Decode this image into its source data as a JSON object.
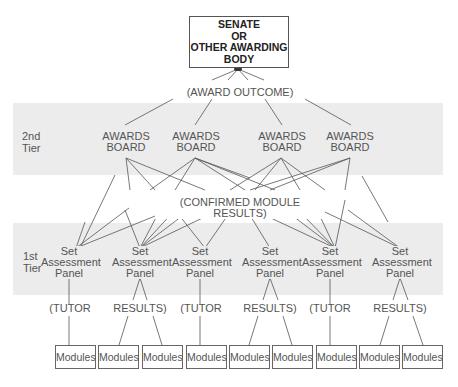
{
  "diagram": {
    "top_body": {
      "lines": [
        "SENATE",
        "OR",
        "OTHER AWARDING",
        "BODY"
      ]
    },
    "award_outcome_label": "(AWARD OUTCOME)",
    "tiers": [
      {
        "label_line1": "2nd",
        "label_line2": "Tier"
      },
      {
        "label_line1": "1st",
        "label_line2": "Tier"
      }
    ],
    "awards_boards": [
      {
        "line1": "AWARDS",
        "line2": "BOARD"
      },
      {
        "line1": "AWARDS",
        "line2": "BOARD"
      },
      {
        "line1": "AWARDS",
        "line2": "BOARD"
      },
      {
        "line1": "AWARDS",
        "line2": "BOARD"
      }
    ],
    "confirmed_label": "(CONFIRMED MODULE RESULTS)",
    "panels": [
      {
        "line1": "Set",
        "line2": "Assessment",
        "line3": "Panel"
      },
      {
        "line1": "Set",
        "line2": "Assessment",
        "line3": "Panel"
      },
      {
        "line1": "Set",
        "line2": "Assessment",
        "line3": "Panel"
      },
      {
        "line1": "Set",
        "line2": "Assessment",
        "line3": "Panel"
      },
      {
        "line1": "Set",
        "line2": "Assessment",
        "line3": "Panel"
      },
      {
        "line1": "Set",
        "line2": "Assessment",
        "line3": "Panel"
      }
    ],
    "panel_outputs": [
      "(TUTOR",
      "RESULTS)",
      "(TUTOR",
      "RESULTS)",
      "(TUTOR",
      "RESULTS)"
    ],
    "modules": [
      "Modules",
      "Modules",
      "Modules",
      "Modules",
      "Modules",
      "Modules",
      "Modules",
      "Modules",
      "Modules"
    ]
  }
}
